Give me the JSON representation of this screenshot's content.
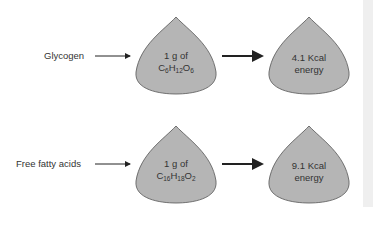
{
  "rows": [
    {
      "source_label": "Glycogen",
      "input_line1": "1 g of",
      "formula": [
        {
          "t": "C"
        },
        {
          "s": "6"
        },
        {
          "t": "H"
        },
        {
          "s": "12"
        },
        {
          "t": "O"
        },
        {
          "s": "6"
        }
      ],
      "formula_text": "C6H12O6",
      "output_line1": "4.1 Kcal",
      "output_line2": "energy"
    },
    {
      "source_label": "Free fatty acids",
      "input_line1": "1 g of",
      "formula": [
        {
          "t": "C"
        },
        {
          "s": "16"
        },
        {
          "t": "H"
        },
        {
          "s": "18"
        },
        {
          "t": "O"
        },
        {
          "s": "2"
        }
      ],
      "formula_text": "C16H18O2",
      "output_line1": "9.1 Kcal",
      "output_line2": "energy"
    }
  ],
  "colors": {
    "shape_fill": "#b5b5b5",
    "shape_stroke": "#555555",
    "arrow": "#222222",
    "text": "#333333"
  }
}
